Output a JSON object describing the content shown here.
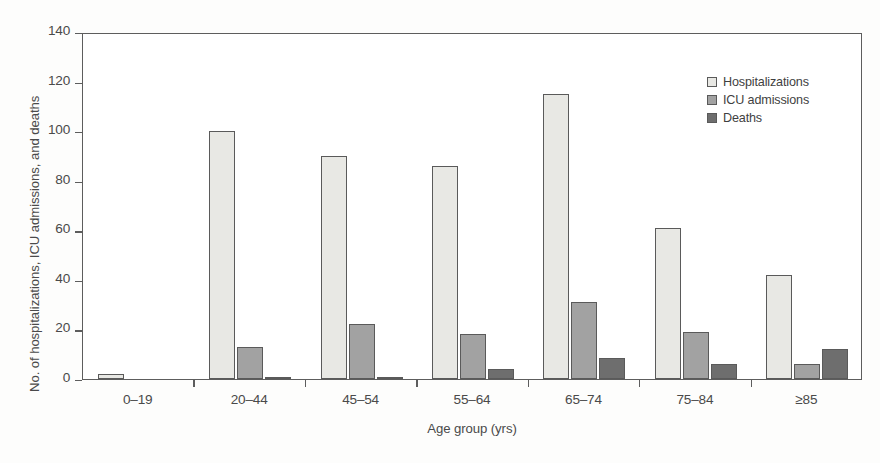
{
  "chart_data": {
    "type": "bar",
    "title": "",
    "subtitle": "",
    "xlabel": "Age group (yrs)",
    "ylabel": "No. of hospitalizations, ICU admissions, and deaths",
    "categories": [
      "0–19",
      "20–44",
      "45–54",
      "55–64",
      "65–74",
      "75–84",
      "≥85"
    ],
    "series": [
      {
        "name": "Hospitalizations",
        "color": "#e8e8e4",
        "values": [
          2,
          100,
          90,
          86,
          115,
          61,
          42
        ]
      },
      {
        "name": "ICU admissions",
        "color": "#a2a2a2",
        "values": [
          0,
          13,
          22,
          18,
          31,
          19,
          6
        ]
      },
      {
        "name": "Deaths",
        "color": "#6e6e6e",
        "values": [
          0,
          0.5,
          1,
          4,
          8.5,
          6,
          12
        ]
      }
    ],
    "ylim": [
      0,
      140
    ],
    "yticks": [
      0,
      20,
      40,
      60,
      80,
      100,
      120,
      140
    ],
    "ytick_labels": [
      "0",
      "20",
      "40",
      "60",
      "80",
      "100",
      "120",
      "140"
    ],
    "grid": false,
    "legend_position": "top-right",
    "axis_color": "#5d5d5d",
    "bar_border_color": "#5a5a5a",
    "background": "#ffffff"
  },
  "legend": {
    "entries": [
      {
        "label": "Hospitalizations"
      },
      {
        "label": "ICU admissions"
      },
      {
        "label": "Deaths"
      }
    ]
  }
}
